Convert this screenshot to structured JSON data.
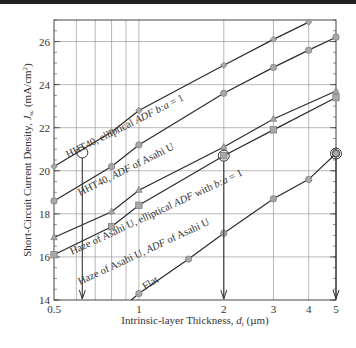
{
  "chart_data": {
    "type": "line",
    "title": "",
    "xlabel": "Intrinsic-layer Thickness, d_i (µm)",
    "xlabel_main": "Intrinsic-layer Thickness, ",
    "xlabel_var": "d",
    "xlabel_sub": "i",
    "xlabel_unit": " (µm)",
    "ylabel": "Short-Circuit Current Density, J_sc (mA/cm²)",
    "ylabel_main": "Short-Circuit Current Density, ",
    "ylabel_var": "J",
    "ylabel_sub": "sc",
    "ylabel_unit": " (mA/cm",
    "ylabel_sup": "2",
    "ylabel_close": ")",
    "xscale": "log",
    "xlim": [
      0.5,
      5
    ],
    "ylim": [
      14,
      27
    ],
    "grid": true,
    "x_ticks": [
      {
        "value": 0.5,
        "label": "0.5"
      },
      {
        "value": 1,
        "label": "1"
      },
      {
        "value": 2,
        "label": "2"
      },
      {
        "value": 3,
        "label": "3"
      },
      {
        "value": 4,
        "label": "4"
      },
      {
        "value": 5,
        "label": "5"
      }
    ],
    "y_ticks": [
      {
        "value": 14,
        "label": "14"
      },
      {
        "value": 16,
        "label": "16"
      },
      {
        "value": 18,
        "label": "18"
      },
      {
        "value": 20,
        "label": "20"
      },
      {
        "value": 22,
        "label": "22"
      },
      {
        "value": 24,
        "label": "24"
      },
      {
        "value": 26,
        "label": "26"
      }
    ],
    "series": [
      {
        "name": "HHT40, elliptical ADF b:a = 1",
        "marker": "diamond",
        "x": [
          0.5,
          0.8,
          1,
          2,
          3,
          4
        ],
        "values": [
          20.2,
          21.8,
          22.8,
          24.9,
          26.1,
          26.9
        ]
      },
      {
        "name": "HHT40, ADF of Asahi U",
        "marker": "circle",
        "x": [
          0.5,
          0.8,
          1,
          2,
          3,
          4,
          5
        ],
        "values": [
          18.6,
          20.2,
          21.2,
          23.6,
          24.8,
          25.6,
          26.2
        ]
      },
      {
        "name": "Haze of Asahi U, elliptical ADF with b:a = 1",
        "marker": "triangle",
        "x": [
          0.5,
          0.8,
          1,
          2,
          3,
          5
        ],
        "values": [
          16.9,
          18.1,
          19.1,
          21.1,
          22.4,
          23.7
        ]
      },
      {
        "name": "Haze of Asahi U, ADF of Asahi U",
        "marker": "square",
        "x": [
          0.5,
          0.8,
          1,
          2,
          3,
          5
        ],
        "values": [
          16.1,
          17.4,
          18.4,
          20.7,
          21.9,
          23.4
        ]
      },
      {
        "name": "Flat",
        "marker": "circle",
        "x": [
          0.94,
          1,
          1.5,
          2,
          3,
          4,
          5
        ],
        "values": [
          14.0,
          14.3,
          15.9,
          17.1,
          18.7,
          19.6,
          20.8
        ]
      }
    ],
    "annotations": [
      {
        "type": "circle-marker",
        "x": 0.63,
        "y": 20.85,
        "arrow_to_x": 0.63
      },
      {
        "type": "circle-marker",
        "x": 2,
        "y": 20.7,
        "arrow_to_x": 2
      },
      {
        "type": "double-circle-marker",
        "x": 5,
        "y": 20.8,
        "arrow_to_x": 5
      }
    ],
    "series_labels": [
      {
        "text_main": "HHT40, elliptical ",
        "text_var": "ADF",
        "text_tail": " b:a = 1"
      },
      {
        "text_main": "HHT40, ",
        "text_var": "ADF",
        "text_tail": " of Asahi U"
      },
      {
        "text_main": "Haze of Asahi U, elliptical ",
        "text_var": "ADF",
        "text_tail": " with b:a = 1"
      },
      {
        "text_main": "Haze of Asahi U, ",
        "text_var": "ADF",
        "text_tail": " of Asahi U"
      },
      {
        "text_main": "Flat",
        "text_var": "",
        "text_tail": ""
      }
    ],
    "colors": {
      "line": "#2a2a2a",
      "marker_fill": "#a8a8a8",
      "marker_stroke": "#777777",
      "grid": "#9a9a9a",
      "text": "#333333"
    }
  }
}
